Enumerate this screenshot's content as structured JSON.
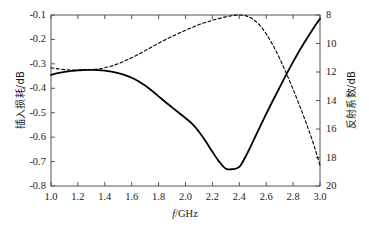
{
  "chart_data": {
    "type": "line",
    "title": "",
    "xlabel": "f/GHz",
    "xlabel_italic_part": "f",
    "xlabel_rest": "/GHz",
    "ylabel_left": "插入损耗/dB",
    "ylabel_right": "反射系数/dB",
    "xlim": [
      1.0,
      3.0
    ],
    "ylim_left": [
      -0.8,
      -0.1
    ],
    "ylim_right": [
      20,
      8
    ],
    "xticks": [
      "1.0",
      "1.2",
      "1.4",
      "1.6",
      "1.8",
      "2.0",
      "2.2",
      "2.4",
      "2.6",
      "2.8",
      "3.0"
    ],
    "xtick_values": [
      1.0,
      1.2,
      1.4,
      1.6,
      1.8,
      2.0,
      2.2,
      2.4,
      2.6,
      2.8,
      3.0
    ],
    "yticks_left": [
      "-0.1",
      "-0.2",
      "-0.3",
      "-0.4",
      "-0.5",
      "-0.6",
      "-0.7",
      "-0.8"
    ],
    "ytick_values_left": [
      -0.1,
      -0.2,
      -0.3,
      -0.4,
      -0.5,
      -0.6,
      -0.7,
      -0.8
    ],
    "yticks_right": [
      "8",
      "10",
      "12",
      "14",
      "16",
      "18",
      "20"
    ],
    "ytick_values_right": [
      8,
      10,
      12,
      14,
      16,
      18,
      20
    ],
    "grid": false,
    "legend": "none",
    "tick_direction": "in",
    "frame": "box",
    "series": [
      {
        "name": "insertion-loss",
        "axis": "left",
        "style": "solid",
        "color": "#000000",
        "width": 1.8,
        "x": [
          1.0,
          1.05,
          1.1,
          1.15,
          1.2,
          1.25,
          1.3,
          1.35,
          1.4,
          1.45,
          1.5,
          1.55,
          1.6,
          1.65,
          1.7,
          1.75,
          1.8,
          1.85,
          1.9,
          1.95,
          2.0,
          2.05,
          2.1,
          2.15,
          2.2,
          2.25,
          2.3,
          2.35,
          2.4,
          2.45,
          2.5,
          2.55,
          2.6,
          2.65,
          2.7,
          2.75,
          2.8,
          2.85,
          2.9,
          2.95,
          3.0
        ],
        "y": [
          -0.345,
          -0.338,
          -0.333,
          -0.329,
          -0.327,
          -0.325,
          -0.325,
          -0.326,
          -0.328,
          -0.332,
          -0.338,
          -0.346,
          -0.357,
          -0.371,
          -0.389,
          -0.41,
          -0.433,
          -0.456,
          -0.478,
          -0.5,
          -0.522,
          -0.546,
          -0.578,
          -0.617,
          -0.66,
          -0.7,
          -0.729,
          -0.731,
          -0.722,
          -0.676,
          -0.62,
          -0.562,
          -0.505,
          -0.45,
          -0.396,
          -0.343,
          -0.292,
          -0.243,
          -0.198,
          -0.155,
          -0.115
        ]
      },
      {
        "name": "reflection-coefficient",
        "axis": "right",
        "style": "dashed",
        "color": "#000000",
        "width": 1.1,
        "dash": "3,2.4",
        "x": [
          1.0,
          1.05,
          1.1,
          1.15,
          1.2,
          1.25,
          1.3,
          1.35,
          1.4,
          1.45,
          1.5,
          1.55,
          1.6,
          1.65,
          1.7,
          1.75,
          1.8,
          1.85,
          1.9,
          1.95,
          2.0,
          2.05,
          2.1,
          2.15,
          2.2,
          2.25,
          2.3,
          2.35,
          2.4,
          2.45,
          2.5,
          2.55,
          2.6,
          2.65,
          2.7,
          2.75,
          2.8,
          2.85,
          2.9,
          2.95,
          3.0
        ],
        "y": [
          11.7,
          11.78,
          11.83,
          11.86,
          11.87,
          11.86,
          11.83,
          11.78,
          11.7,
          11.58,
          11.42,
          11.22,
          11.0,
          10.76,
          10.5,
          10.24,
          9.98,
          9.73,
          9.5,
          9.28,
          9.07,
          8.87,
          8.68,
          8.52,
          8.37,
          8.24,
          8.13,
          8.04,
          8.0,
          8.06,
          8.28,
          8.7,
          9.32,
          10.12,
          11.05,
          12.1,
          13.22,
          14.4,
          15.65,
          17.0,
          18.55
        ]
      }
    ]
  },
  "plot_geometry": {
    "left": 51,
    "right": 320,
    "top": 15,
    "bottom": 186
  }
}
